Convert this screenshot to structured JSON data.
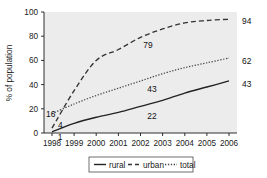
{
  "chart_data": {
    "type": "line",
    "title": "",
    "xlabel": "",
    "ylabel": "% of population",
    "xlim": [
      1998,
      2006
    ],
    "ylim": [
      0,
      100
    ],
    "grid": false,
    "legend_position": "bottom",
    "x": [
      1998,
      1999,
      2000,
      2001,
      2002,
      2003,
      2004,
      2005,
      2006
    ],
    "xtick_labels": [
      "1998",
      "1999",
      "2000",
      "2001",
      "2002",
      "2003",
      "2004",
      "2005",
      "2006"
    ],
    "ytick_labels": [
      "0",
      "20",
      "40",
      "60",
      "80",
      "100"
    ],
    "ytick_values": [
      0,
      20,
      40,
      60,
      80,
      100
    ],
    "series": [
      {
        "name": "rural",
        "style": "solid",
        "color": "#222222",
        "values": [
          1,
          8,
          13,
          17,
          22,
          27,
          33,
          38,
          43
        ]
      },
      {
        "name": "urban",
        "style": "dashed",
        "color": "#333333",
        "values": [
          4,
          35,
          60,
          69,
          79,
          86,
          91,
          93,
          94
        ]
      },
      {
        "name": "total",
        "style": "dotted",
        "color": "#444444",
        "values": [
          16,
          24,
          31,
          37,
          43,
          49,
          54,
          58,
          62
        ]
      }
    ],
    "annotations": [
      {
        "text": "16",
        "series": "total",
        "x": 1998,
        "value": 16
      },
      {
        "text": "4",
        "series": "urban",
        "x": 1998,
        "value": 4
      },
      {
        "text": "1",
        "series": "rural",
        "x": 1998,
        "value": 1
      },
      {
        "text": "79",
        "series": "urban",
        "x": 2002,
        "value": 79
      },
      {
        "text": "43",
        "series": "total",
        "x": 2002,
        "value": 43
      },
      {
        "text": "22",
        "series": "rural",
        "x": 2002,
        "value": 22
      },
      {
        "text": "94",
        "series": "urban",
        "x": 2006,
        "value": 94
      },
      {
        "text": "62",
        "series": "total",
        "x": 2006,
        "value": 62
      },
      {
        "text": "43",
        "series": "rural",
        "x": 2006,
        "value": 43
      }
    ]
  },
  "axes": {
    "ylabel": "% of population",
    "yticks": [
      "100",
      "80",
      "60",
      "40",
      "20",
      "0"
    ],
    "xticks": [
      "1998",
      "1999",
      "2000",
      "2001",
      "2002",
      "2003",
      "2004",
      "2005",
      "2006"
    ]
  },
  "labels": {
    "l_16": "16",
    "l_4": "4",
    "l_1": "1",
    "l_79": "79",
    "l_43_mid": "43",
    "l_22": "22",
    "l_94": "94",
    "l_62": "62",
    "l_43_right": "43"
  },
  "legend": {
    "items": [
      {
        "label": "rural",
        "style": "solid"
      },
      {
        "label": "urban",
        "style": "dashed"
      },
      {
        "label": "total",
        "style": "dotted"
      }
    ]
  },
  "colors": {
    "plot_background": "#ececec",
    "page_background": "#ffffff",
    "axis": "#1a1a1a",
    "rural": "#222222",
    "urban": "#333333",
    "total": "#444444"
  }
}
